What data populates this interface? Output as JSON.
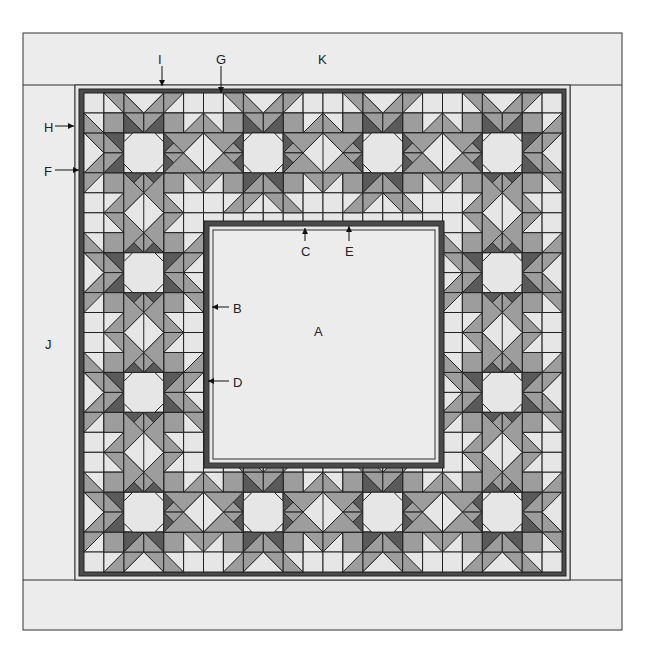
{
  "diagram": {
    "type": "quilt-layout",
    "colors": {
      "light": "#e6e6e6",
      "border_band": "#ececec",
      "mid": "#9d9d9d",
      "dark": "#5a5a5a",
      "frame_dark": "#4a4a4a",
      "line": "#222222"
    },
    "grid": {
      "cols": 24,
      "rows": 24,
      "x": 84,
      "y": 93,
      "w": 478,
      "h": 479,
      "star_period": 6
    },
    "center_panel": {
      "x": 204,
      "y": 221,
      "w": 240,
      "h": 247
    }
  },
  "labels": [
    {
      "id": "A",
      "text": "A",
      "x": 314,
      "y": 325,
      "target": "center-panel"
    },
    {
      "id": "B",
      "text": "B",
      "x": 233,
      "y": 302,
      "arrow": "left",
      "arrow_from": 229,
      "arrow_to": 213
    },
    {
      "id": "C",
      "text": "C",
      "x": 301,
      "y": 245,
      "arrow": "up"
    },
    {
      "id": "D",
      "text": "D",
      "x": 233,
      "y": 376,
      "arrow": "left",
      "arrow_from": 229,
      "arrow_to": 210
    },
    {
      "id": "E",
      "text": "E",
      "x": 345,
      "y": 245,
      "arrow": "up"
    },
    {
      "id": "F",
      "text": "F",
      "x": 44,
      "y": 165,
      "arrow": "right"
    },
    {
      "id": "G",
      "text": "G",
      "x": 216,
      "y": 53,
      "arrow": "down"
    },
    {
      "id": "H",
      "text": "H",
      "x": 44,
      "y": 121,
      "arrow": "right"
    },
    {
      "id": "I",
      "text": "I",
      "x": 158,
      "y": 53,
      "arrow": "down"
    },
    {
      "id": "J",
      "text": "J",
      "x": 45,
      "y": 338
    },
    {
      "id": "K",
      "text": "K",
      "x": 318,
      "y": 53
    }
  ]
}
